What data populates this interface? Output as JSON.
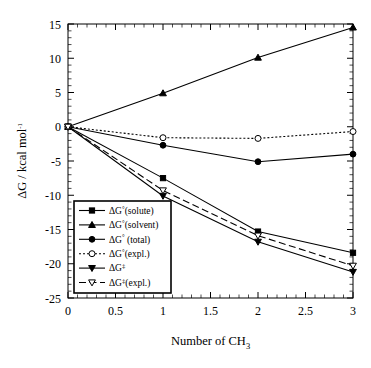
{
  "chart_data": {
    "type": "line",
    "title": "",
    "xlabel": "Number of CH3",
    "xlabel_main": "Number of CH",
    "xlabel_sub": "3",
    "ylabel": "ΔG / kcal mol-1",
    "ylabel_main": "ΔG / kcal mol",
    "ylabel_sup": "-1",
    "x": [
      0,
      1,
      2,
      3
    ],
    "xlim": [
      0,
      3
    ],
    "ylim": [
      -25,
      15
    ],
    "xticks": [
      0,
      0.5,
      1,
      1.5,
      2,
      2.5,
      3
    ],
    "xticklabels": [
      "0",
      "0.5",
      "1",
      "1.5",
      "2",
      "2.5",
      "3"
    ],
    "yticks": [
      -25,
      -20,
      -15,
      -10,
      -5,
      0,
      5,
      10,
      15
    ],
    "yticklabels": [
      "-25",
      "-20",
      "-15",
      "-10",
      "-5",
      "0",
      "5",
      "10",
      "15"
    ],
    "grid": false,
    "minor_ticks": true,
    "legend_position": "lower left",
    "series": [
      {
        "name": "ΔG°(solute)",
        "label_main": "ΔG",
        "label_sup": "°",
        "label_tail": "(solute)",
        "marker": "filled-square",
        "line": "solid",
        "color": "#000000",
        "values": [
          0,
          -7.5,
          -15.3,
          -18.4
        ]
      },
      {
        "name": "ΔG°(solvent)",
        "label_main": "ΔG",
        "label_sup": "°",
        "label_tail": "(solvent)",
        "marker": "filled-triangle",
        "line": "solid",
        "color": "#000000",
        "values": [
          0,
          4.9,
          10.1,
          14.5
        ]
      },
      {
        "name": "ΔG° (total)",
        "label_main": "ΔG",
        "label_sup": "°",
        "label_tail": " (total)",
        "marker": "filled-circle",
        "line": "solid",
        "color": "#000000",
        "values": [
          0,
          -2.7,
          -5.1,
          -4.0
        ]
      },
      {
        "name": "ΔG°(expl.)",
        "label_main": "ΔG",
        "label_sup": "°",
        "label_tail": "(expl.)",
        "marker": "open-circle",
        "line": "dotted",
        "color": "#000000",
        "values": [
          0,
          -1.6,
          -1.7,
          -0.7
        ]
      },
      {
        "name": "ΔG‡",
        "label_main": "ΔG",
        "label_sup": "‡",
        "label_tail": "",
        "marker": "filled-down-triangle",
        "line": "solid",
        "color": "#000000",
        "values": [
          0,
          -10.1,
          -16.8,
          -21.2
        ]
      },
      {
        "name": "ΔG‡(expl.)",
        "label_main": "ΔG",
        "label_sup": "‡",
        "label_tail": "(expl.)",
        "marker": "open-down-triangle",
        "line": "dashed",
        "color": "#000000",
        "values": [
          0,
          -9.3,
          -15.9,
          -20.3
        ]
      }
    ]
  }
}
